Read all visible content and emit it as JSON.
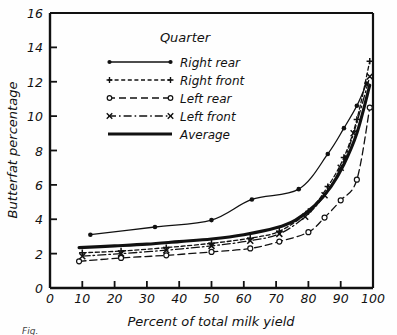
{
  "figure": {
    "caption": "Fig.",
    "background": "#fefefe",
    "ink": "#111111"
  },
  "chart_data": {
    "type": "line",
    "title": "",
    "xlabel": "Percent of total milk yield",
    "ylabel": "Butterfat percentage",
    "xlim": [
      0,
      100
    ],
    "ylim": [
      0,
      16
    ],
    "xticks": [
      0,
      10,
      20,
      30,
      40,
      50,
      60,
      70,
      80,
      90,
      100
    ],
    "yticks": [
      0,
      2,
      4,
      6,
      8,
      10,
      12,
      14,
      16
    ],
    "grid": false,
    "legend_position": "top-center",
    "legend_title": "Quarter",
    "series": [
      {
        "name": "Right rear",
        "style": "solid",
        "marker": "dot",
        "x": [
          12.5,
          32.5,
          50.0,
          62.5,
          77.0,
          86.0,
          91.0,
          95.0,
          98.0
        ],
        "y": [
          3.1,
          3.55,
          3.95,
          5.15,
          5.75,
          7.8,
          9.3,
          10.6,
          11.9
        ]
      },
      {
        "name": "Right front",
        "style": "dotted",
        "marker": "plus",
        "x": [
          10.0,
          22.0,
          36.0,
          50.0,
          62.0,
          71.0,
          80.0,
          86.0,
          91.0,
          95.0,
          99.0
        ],
        "y": [
          2.05,
          2.15,
          2.35,
          2.6,
          2.9,
          3.3,
          4.45,
          5.9,
          7.6,
          9.8,
          13.2
        ]
      },
      {
        "name": "Left rear",
        "style": "dashed",
        "marker": "circle",
        "x": [
          9.0,
          22.0,
          36.0,
          50.0,
          62.0,
          71.0,
          80.0,
          85.0,
          90.0,
          95.0,
          99.0
        ],
        "y": [
          1.55,
          1.75,
          1.9,
          2.1,
          2.3,
          2.7,
          3.25,
          4.1,
          5.1,
          6.3,
          10.5
        ]
      },
      {
        "name": "Left front",
        "style": "dashdot",
        "marker": "cross",
        "x": [
          10.0,
          22.0,
          36.0,
          50.0,
          62.0,
          71.0,
          79.0,
          85.0,
          90.0,
          94.0,
          99.0
        ],
        "y": [
          1.85,
          2.0,
          2.2,
          2.45,
          2.75,
          3.15,
          4.15,
          5.4,
          7.0,
          9.0,
          12.3
        ]
      },
      {
        "name": "Average",
        "style": "solid-thick",
        "marker": "none",
        "x": [
          9.0,
          20.0,
          30.0,
          40.0,
          50.0,
          60.0,
          70.0,
          76.0,
          82.0,
          87.0,
          91.0,
          95.0,
          99.0
        ],
        "y": [
          2.35,
          2.45,
          2.55,
          2.7,
          2.85,
          3.1,
          3.5,
          3.95,
          4.8,
          5.9,
          7.2,
          9.0,
          11.8
        ]
      }
    ]
  },
  "legend": {
    "title": "Quarter",
    "items": [
      {
        "label": "Right rear"
      },
      {
        "label": "Right front"
      },
      {
        "label": "Left rear"
      },
      {
        "label": "Left front"
      },
      {
        "label": "Average"
      }
    ]
  }
}
